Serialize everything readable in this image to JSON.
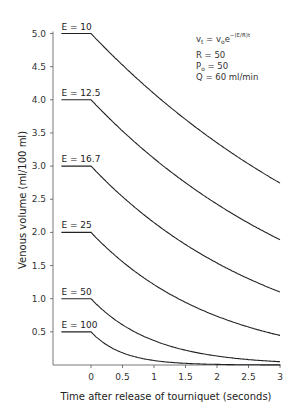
{
  "chart_data": {
    "type": "line",
    "title": "",
    "xlabel": "Time after release of tourniquet (seconds)",
    "ylabel": "Venous volume (ml/100 ml)",
    "xlim": [
      -0.6,
      3
    ],
    "ylim": [
      0,
      5.0
    ],
    "x_ticks": [
      "0",
      "0.5",
      "1",
      "1.5",
      "2",
      "2.5",
      "3"
    ],
    "y_ticks": [
      "0.5",
      "1.0",
      "1.5",
      "2.0",
      "2.5",
      "3.0",
      "3.5",
      "4.0",
      "4.5",
      "5.0"
    ],
    "grid": false,
    "annotation": {
      "formula_lhs": "v",
      "formula_lhs_sub": "t",
      "formula_eq": "=",
      "formula_rhs": "v",
      "formula_rhs_sub": "o",
      "formula_exp_base": "e",
      "formula_exp": "−(E/R)t",
      "params": [
        {
          "name": "R",
          "sub": "",
          "value": "50"
        },
        {
          "name": "P",
          "sub": "o",
          "value": "50"
        },
        {
          "name": "Q",
          "sub": "",
          "value": "60 ml/min"
        }
      ]
    },
    "series": [
      {
        "name": "E = 10",
        "E": 10,
        "v0": 5.0,
        "x": [
          -0.47,
          0,
          0.5,
          1,
          1.5,
          2,
          2.5,
          3
        ],
        "values": [
          5.0,
          5.0,
          4.52,
          4.09,
          3.7,
          3.35,
          3.03,
          2.74
        ]
      },
      {
        "name": "E = 12.5",
        "E": 12.5,
        "v0": 4.0,
        "x": [
          -0.47,
          0,
          0.5,
          1,
          1.5,
          2,
          2.5,
          3
        ],
        "values": [
          4.0,
          4.0,
          3.53,
          3.12,
          2.75,
          2.43,
          2.14,
          1.89
        ]
      },
      {
        "name": "E = 16.7",
        "E": 16.7,
        "v0": 3.0,
        "x": [
          -0.47,
          0,
          0.5,
          1,
          1.5,
          2,
          2.5,
          3
        ],
        "values": [
          3.0,
          3.0,
          2.54,
          2.15,
          1.82,
          1.54,
          1.3,
          1.1
        ]
      },
      {
        "name": "E = 25",
        "E": 25,
        "v0": 2.0,
        "x": [
          -0.47,
          0,
          0.5,
          1,
          1.5,
          2,
          2.5,
          3
        ],
        "values": [
          2.0,
          2.0,
          1.56,
          1.21,
          0.94,
          0.74,
          0.57,
          0.45
        ]
      },
      {
        "name": "E = 50",
        "E": 50,
        "v0": 1.0,
        "x": [
          -0.47,
          0,
          0.5,
          1,
          1.5,
          2,
          2.5,
          3
        ],
        "values": [
          1.0,
          1.0,
          0.61,
          0.37,
          0.22,
          0.14,
          0.08,
          0.05
        ]
      },
      {
        "name": "E = 100",
        "E": 100,
        "v0": 0.5,
        "x": [
          -0.47,
          0,
          0.5,
          1,
          1.5,
          2,
          2.5,
          3
        ],
        "values": [
          0.5,
          0.5,
          0.18,
          0.07,
          0.02,
          0.01,
          0.003,
          0.001
        ]
      }
    ]
  }
}
